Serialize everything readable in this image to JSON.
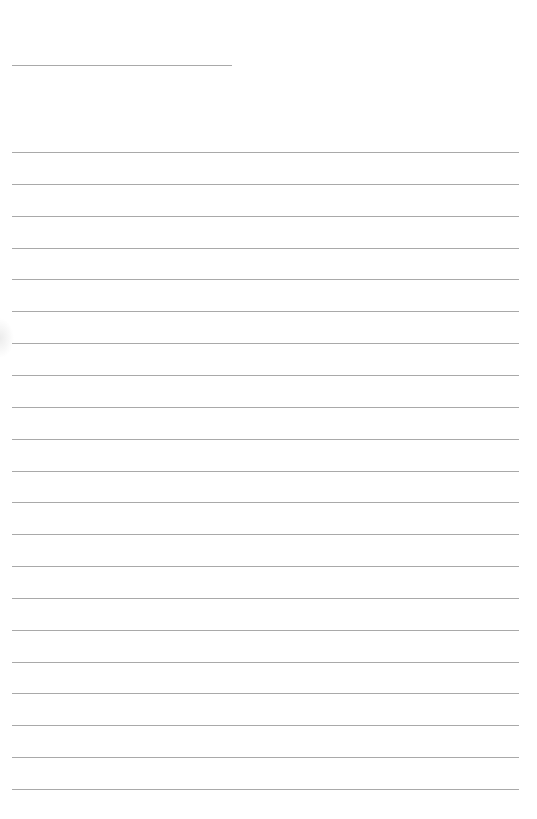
{
  "page": {
    "type": "lined-writing-paper",
    "background_color": "#ffffff",
    "line_color": "#a9a9a9",
    "header_line": {
      "x_start": 12,
      "x_end": 232,
      "y": 65
    },
    "ruled_lines": {
      "count": 21,
      "x_start": 12,
      "x_end": 519,
      "y_first": 152,
      "spacing": 31.85
    }
  }
}
